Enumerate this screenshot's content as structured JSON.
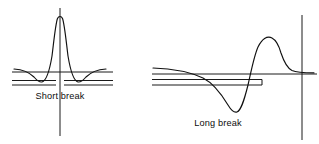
{
  "figure": {
    "background_color": "#ffffff",
    "ink_color": "#111111",
    "panels": [
      {
        "id": "short-break",
        "caption": "Short break",
        "caption_x": 60,
        "caption_y": 99,
        "vertical_axis": {
          "x": 60,
          "y_top": 8,
          "y_bottom": 136
        },
        "horizontal_axis": {
          "y": 72,
          "x_left": 12,
          "x_right": 113
        },
        "break_marker": {
          "y_upper": 80,
          "y_lower": 85,
          "left_segment": {
            "x_start": 12,
            "x_end": 56
          },
          "right_segment": {
            "x_start": 64,
            "x_end": 113
          }
        },
        "trace": {
          "description": "sharp tall symmetric peak with shallow negative lobes on both sides",
          "peak_x": 60,
          "peak_y": 17,
          "left_trough_x": 40,
          "left_trough_y": 82,
          "right_trough_x": 80,
          "right_trough_y": 82,
          "baseline_y": 70
        }
      },
      {
        "id": "long-break",
        "caption": "Long break",
        "caption_x": 218,
        "caption_y": 126,
        "vertical_axis": {
          "x": 302,
          "y_top": 15,
          "y_bottom": 140
        },
        "horizontal_axis": {
          "y": 74,
          "x_left": 152,
          "x_right": 316
        },
        "break_marker": {
          "y_upper": 79,
          "y_lower": 85,
          "segment": {
            "x_start": 152,
            "x_end": 262
          }
        },
        "trace": {
          "description": "dispersive derivative-shaped curve: long shallow descent to a trough then a steep rise to a sharp peak with slow decay",
          "trough_x": 232,
          "trough_y": 112,
          "peak_x": 272,
          "peak_y": 38,
          "zero_crossing_x": 253,
          "baseline_y": 70,
          "decay_tail_y": 70
        }
      }
    ]
  },
  "labels": {
    "short_break": "Short break",
    "long_break": "Long break"
  }
}
